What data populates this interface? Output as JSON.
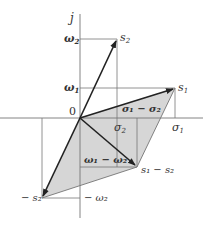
{
  "diagram": {
    "axes": {
      "vertical_label": "j",
      "origin_label": "0"
    },
    "points": {
      "origin": {
        "x": 80,
        "y": 118
      },
      "s1": {
        "x": 175,
        "y": 88
      },
      "s2": {
        "x": 117,
        "y": 39
      },
      "s1_minus_s2": {
        "x": 137,
        "y": 167
      },
      "neg_s2": {
        "x": 42,
        "y": 198
      }
    },
    "labels": {
      "s1": "s",
      "s1_sub": "1",
      "s2": "s",
      "s2_sub": "2",
      "omega1": "ω",
      "omega1_sub": "1",
      "omega2": "ω",
      "omega2_sub": "2",
      "sigma1": "σ",
      "sigma1_sub": "1",
      "sigma2": "σ",
      "sigma2_sub": "2",
      "sigma_diff": "σ₁ − σ₂",
      "omega_diff": "ω₁ − ω₂",
      "s_diff": "s₁ − s₂",
      "neg_s2": "− s₂",
      "neg_omega2": "− ω₂"
    },
    "colors": {
      "fill": "#d4d4d4",
      "vector": "#222222",
      "guide": "#777777",
      "text": "#333333"
    }
  }
}
